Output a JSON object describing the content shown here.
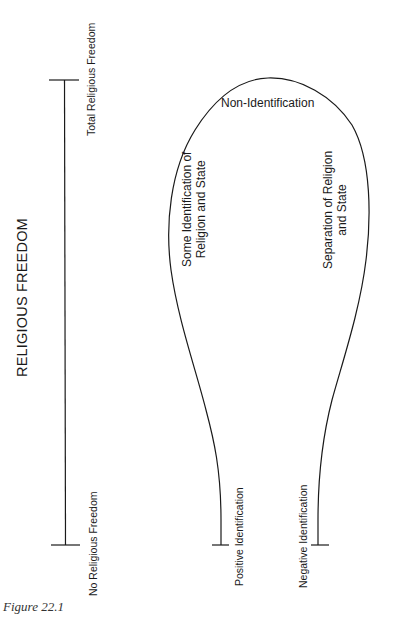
{
  "figure": {
    "caption": "Figure 22.1",
    "colors": {
      "line": "#1a1a1a",
      "text": "#1a1a1a",
      "background": "#ffffff"
    }
  },
  "axis": {
    "title": "RELIGIOUS FREEDOM",
    "top_label": "Total Religious Freedom",
    "bottom_label": "No Religious Freedom"
  },
  "bulb": {
    "top_label": "Non-Identification",
    "left_label_line1": "Some Identification of",
    "left_label_line2": "Religion and State",
    "right_label_line1": "Separation of Religion",
    "right_label_line2": "and State",
    "left_end_label": "Positive Identification",
    "right_end_label": "Negative Identification"
  }
}
